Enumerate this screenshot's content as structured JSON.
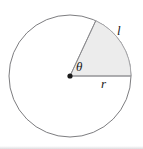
{
  "figure": {
    "kind": "geometry-diagram",
    "canvas": {
      "width": 143,
      "height": 149,
      "background": "#ffffff"
    },
    "circle": {
      "center_x": 70,
      "center_y": 76,
      "radius": 61,
      "stroke": "#7d7d80",
      "stroke_width": 1,
      "fill": "#ffffff"
    },
    "sector": {
      "start_angle_deg": 0,
      "end_angle_deg": 65,
      "fill": "#ececec",
      "stroke": "#a8a8ab",
      "stroke_width": 1
    },
    "center_dot": {
      "radius": 2.6,
      "color": "#1a1a1a"
    },
    "labels": {
      "theta": "θ",
      "arc_length": "l",
      "radius": "r"
    }
  }
}
